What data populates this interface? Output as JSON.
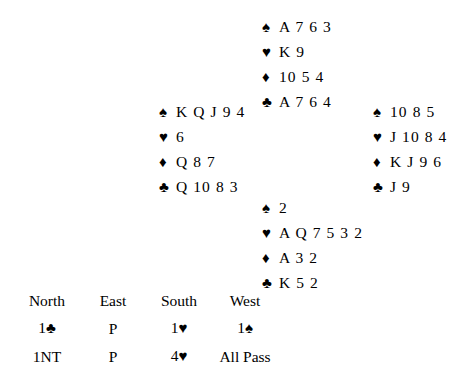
{
  "suits": {
    "spade": "♠",
    "heart": "♥",
    "diamond": "♦",
    "club": "♣"
  },
  "hands": {
    "north": {
      "label": "North",
      "spades": "A 7 6 3",
      "hearts": "K 9",
      "diamonds": "10 5 4",
      "clubs": "A 7 6 4"
    },
    "west": {
      "label": "West",
      "spades": "K Q J 9 4",
      "hearts": "6",
      "diamonds": "Q 8 7",
      "clubs": "Q 10 8 3"
    },
    "east": {
      "label": "East",
      "spades": "10 8 5",
      "hearts": "J 10 8 4",
      "diamonds": "K J 9 6",
      "clubs": "J 9"
    },
    "south": {
      "label": "South",
      "spades": "2",
      "hearts": "A Q 7 5 3 2",
      "diamonds": "A 3 2",
      "clubs": "K 5 2"
    }
  },
  "auction": {
    "headers": [
      "North",
      "East",
      "South",
      "West"
    ],
    "rows": [
      [
        {
          "level": "1",
          "suit": "♣",
          "text": ""
        },
        {
          "level": "",
          "suit": "",
          "text": "P"
        },
        {
          "level": "1",
          "suit": "♥",
          "text": ""
        },
        {
          "level": "1",
          "suit": "♠",
          "text": ""
        }
      ],
      [
        {
          "level": "",
          "suit": "",
          "text": "1NT"
        },
        {
          "level": "",
          "suit": "",
          "text": "P"
        },
        {
          "level": "4",
          "suit": "♥",
          "text": ""
        },
        {
          "level": "",
          "suit": "",
          "text": "All Pass"
        }
      ]
    ]
  }
}
